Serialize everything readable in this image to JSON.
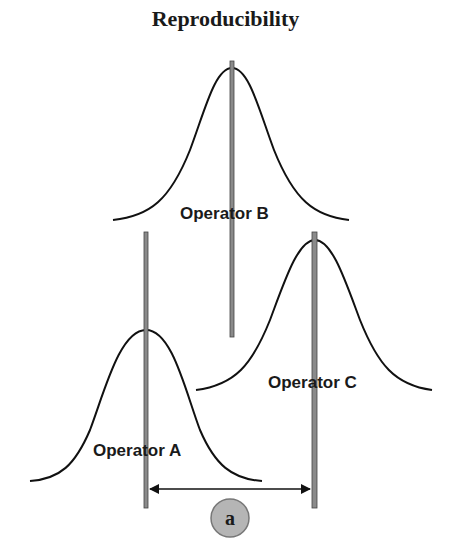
{
  "title": "Reproducibility",
  "colors": {
    "curve": "#111111",
    "mean_line_fill": "#8a8a8a",
    "mean_line_border": "#444444",
    "arrow": "#111111",
    "badge_fill": "#b5b5b5",
    "badge_border": "#777777"
  },
  "operators": [
    {
      "name": "Operator A",
      "label": "Operator A"
    },
    {
      "name": "Operator B",
      "label": "Operator B"
    },
    {
      "name": "Operator C",
      "label": "Operator C"
    }
  ],
  "dimension": {
    "label": "a",
    "from": "Operator A mean",
    "to": "Operator C mean"
  }
}
